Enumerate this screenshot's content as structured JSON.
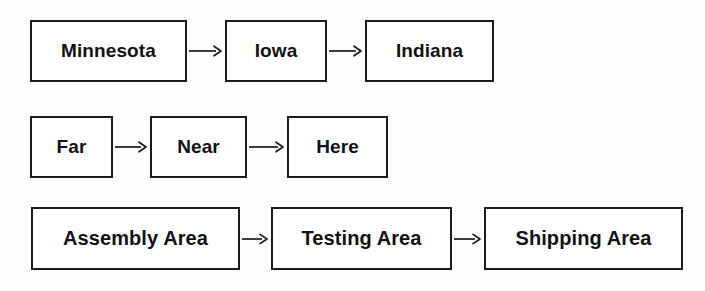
{
  "diagram": {
    "background_color": "#fdfdfd",
    "line_color": "#1b1b1b",
    "box_fill": "#ffffff",
    "text_color": "#111111",
    "connector_label": "arrow-right",
    "rows": [
      {
        "id": "states",
        "nodes": [
          {
            "label": "Minnesota"
          },
          {
            "label": "Iowa"
          },
          {
            "label": "Indiana"
          }
        ],
        "connectors": [
          "→",
          "→"
        ]
      },
      {
        "id": "distance",
        "nodes": [
          {
            "label": "Far"
          },
          {
            "label": "Near"
          },
          {
            "label": "Here"
          }
        ],
        "connectors": [
          "→",
          "→"
        ]
      },
      {
        "id": "areas",
        "nodes": [
          {
            "label": "Assembly Area"
          },
          {
            "label": "Testing Area"
          },
          {
            "label": "Shipping Area"
          }
        ],
        "connectors": [
          "→",
          "→"
        ]
      }
    ]
  }
}
